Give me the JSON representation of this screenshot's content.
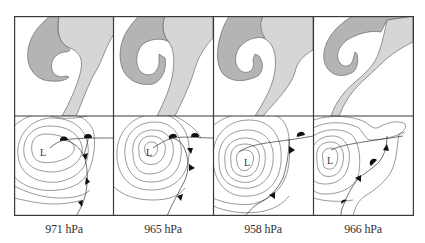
{
  "figure": {
    "colors": {
      "frame": "#3a3a3a",
      "cloud_dark": "#b4b4b4",
      "cloud_light": "#d6d6d6",
      "cloud_outline": "#6a6a6a",
      "isobar": "#555555",
      "front": "#333333",
      "front_symbol": "#111111",
      "label_text": "#333333"
    },
    "panels": [
      {
        "index": 0,
        "low_label": "L",
        "pressure_label": "971 hPa"
      },
      {
        "index": 1,
        "low_label": "L",
        "pressure_label": "965 hPa"
      },
      {
        "index": 2,
        "low_label": "L",
        "pressure_label": "958 hPa"
      },
      {
        "index": 3,
        "low_label": "L",
        "pressure_label": "966 hPa"
      }
    ]
  }
}
